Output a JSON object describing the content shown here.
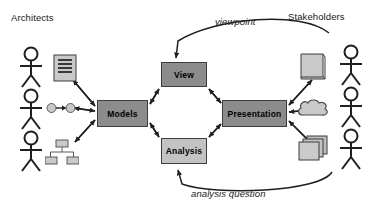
{
  "diagram": {
    "title_left": "Architects",
    "title_right": "Stakeholders",
    "edge_label_top": "viewpoint",
    "edge_label_bottom": "analysis question",
    "nodes": [
      {
        "id": "models",
        "label": "Models",
        "fill": "#8c8c8c",
        "x": 97,
        "y": 100,
        "w": 51,
        "h": 27
      },
      {
        "id": "view",
        "label": "View",
        "fill": "#8c8c8c",
        "x": 161,
        "y": 62,
        "w": 46,
        "h": 25
      },
      {
        "id": "analysis",
        "label": "Analysis",
        "fill": "#c3c3c3",
        "x": 161,
        "y": 138,
        "w": 46,
        "h": 26
      },
      {
        "id": "presentation",
        "label": "Presentation",
        "fill": "#8c8c8c",
        "x": 222,
        "y": 100,
        "w": 65,
        "h": 27
      }
    ],
    "actors": [
      {
        "id": "architect-1",
        "side": "left",
        "x": 18,
        "y": 48
      },
      {
        "id": "architect-2",
        "side": "left",
        "x": 18,
        "y": 92
      },
      {
        "id": "architect-3",
        "side": "left",
        "x": 18,
        "y": 133
      },
      {
        "id": "stakeholder-1",
        "side": "right",
        "x": 338,
        "y": 46
      },
      {
        "id": "stakeholder-2",
        "side": "right",
        "x": 338,
        "y": 90
      },
      {
        "id": "stakeholder-3",
        "side": "right",
        "x": 338,
        "y": 131
      }
    ],
    "artifacts": [
      {
        "id": "document-icon",
        "label": "document",
        "x": 53,
        "y": 54
      },
      {
        "id": "graph-icon",
        "label": "graph",
        "x": 48,
        "y": 101
      },
      {
        "id": "tree-icon",
        "label": "tree",
        "x": 46,
        "y": 140
      },
      {
        "id": "scroll-icon",
        "label": "scroll",
        "x": 300,
        "y": 52
      },
      {
        "id": "cloud-icon",
        "label": "cloud",
        "x": 299,
        "y": 99
      },
      {
        "id": "stack-icon",
        "label": "stack",
        "x": 300,
        "y": 137
      }
    ],
    "colors": {
      "node_dark": "#8c8c8c",
      "node_light": "#c3c3c3",
      "stroke": "#2b2b2b",
      "icon_fill": "#c9c9c9",
      "background": "#ffffff"
    }
  }
}
